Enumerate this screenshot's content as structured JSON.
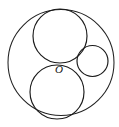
{
  "figure": {
    "background_color": "#ffffff",
    "stroke_color": "#1a1a1a",
    "canvas": {
      "width": 119,
      "height": 127
    },
    "labels": [
      {
        "id": "center-point-o",
        "text": "O",
        "x": 59,
        "y": 70,
        "style": "italic-serif"
      }
    ]
  },
  "chart_data": {
    "type": "scatter",
    "xlabel": "",
    "ylabel": "",
    "xlim": [
      0,
      119
    ],
    "ylim": [
      0,
      127
    ],
    "grid": false,
    "legend": "none",
    "shapes": [
      {
        "name": "outer-circle",
        "type": "circle",
        "cx": 61,
        "cy": 62.5,
        "r": 53,
        "fill": "none",
        "stroke": "#222222",
        "stroke_width": 1.05
      },
      {
        "name": "top-circle",
        "type": "circle",
        "cx": 60,
        "cy": 36,
        "r": 27,
        "fill": "none",
        "stroke": "#1a1a1a",
        "stroke_width": 1.15
      },
      {
        "name": "bottom-circle",
        "type": "circle",
        "cx": 57,
        "cy": 92,
        "r": 27,
        "fill": "none",
        "stroke": "#1a1a1a",
        "stroke_width": 1.15
      },
      {
        "name": "right-small-circle",
        "type": "circle",
        "cx": 92.5,
        "cy": 61,
        "r": 15.5,
        "fill": "none",
        "stroke": "#1a1a1a",
        "stroke_width": 1.15
      }
    ],
    "annotations": [
      {
        "text": "O",
        "x": 59,
        "y": 70
      }
    ]
  }
}
